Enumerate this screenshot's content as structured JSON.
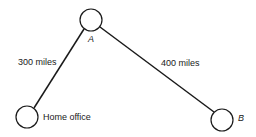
{
  "diagram": {
    "nodes": [
      {
        "id": "home",
        "label": "Home office",
        "cx": 27,
        "cy": 117,
        "r": 11
      },
      {
        "id": "A",
        "label": "A",
        "cx": 91,
        "cy": 20,
        "r": 11
      },
      {
        "id": "B",
        "label": "B",
        "cx": 222,
        "cy": 120,
        "r": 11
      }
    ],
    "edges": [
      {
        "from": "home",
        "to": "A",
        "label": "300 miles"
      },
      {
        "from": "A",
        "to": "B",
        "label": "400 miles"
      }
    ],
    "stroke_color": "#1a1a1a"
  }
}
